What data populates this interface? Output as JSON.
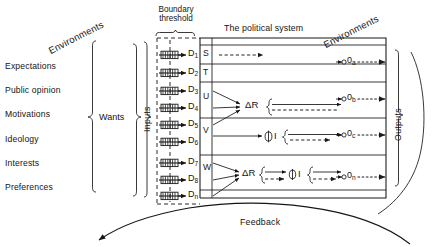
{
  "figure": {
    "type": "systems-flow-diagram",
    "title_center": "The political system",
    "environment_left_label": "Environments",
    "environment_right_label": "Environments",
    "boundary_label_line1": "Boundary",
    "boundary_label_line2": "threshold",
    "feedback_label": "Feedback",
    "wants_label": "Wants",
    "inputs_label": "Inputs",
    "outputs_label": "Outputs"
  },
  "environment_sources": [
    {
      "label": "Expectations"
    },
    {
      "label": "Public opinion"
    },
    {
      "label": "Motivations"
    },
    {
      "label": "Ideology"
    },
    {
      "label": "Interests"
    },
    {
      "label": "Preferences"
    }
  ],
  "demands": [
    {
      "base": "D",
      "sub": "1"
    },
    {
      "base": "D",
      "sub": "2"
    },
    {
      "base": "D",
      "sub": "3"
    },
    {
      "base": "D",
      "sub": "4"
    },
    {
      "base": "D",
      "sub": "5"
    },
    {
      "base": "D",
      "sub": "6"
    },
    {
      "base": "D",
      "sub": "7"
    },
    {
      "base": "D",
      "sub": "8"
    },
    {
      "base": "D",
      "sub": "n"
    }
  ],
  "channels": [
    {
      "label": "S"
    },
    {
      "label": "T"
    },
    {
      "label": "U"
    },
    {
      "label": "V"
    },
    {
      "label": "W"
    }
  ],
  "processors": [
    {
      "label": "ΔR",
      "row": "U"
    },
    {
      "label": "ΦI",
      "row": "V"
    },
    {
      "label": "ΔR",
      "row": "W"
    },
    {
      "label": "ΦI",
      "row": "W"
    }
  ],
  "outputs": [
    {
      "base": "0",
      "sub": "a"
    },
    {
      "base": "0",
      "sub": "b"
    },
    {
      "base": "0",
      "sub": "c"
    },
    {
      "base": "0",
      "sub": "n"
    }
  ],
  "colors": {
    "ink": "#161616",
    "paper": "#ffffff",
    "dash": "#2a2a2a"
  }
}
